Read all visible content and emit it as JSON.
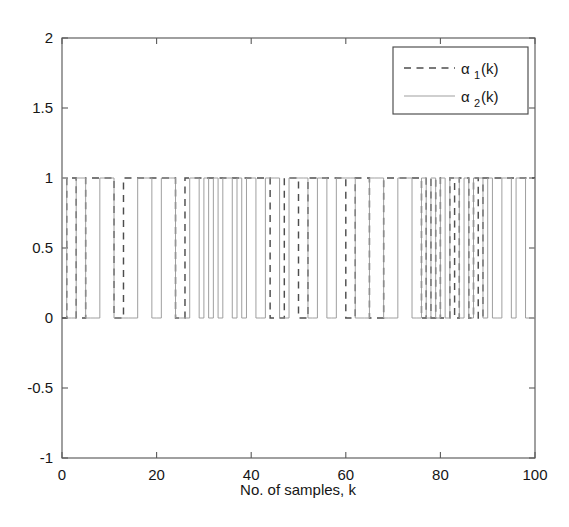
{
  "chart_data": {
    "type": "line",
    "title": "",
    "xlabel": "No. of samples, k",
    "ylabel": "",
    "xlim": [
      0,
      100
    ],
    "ylim": [
      -1,
      2
    ],
    "xticks": [
      0,
      20,
      40,
      60,
      80,
      100
    ],
    "xticklabels": [
      "0",
      "20",
      "40",
      "60",
      "80",
      "100"
    ],
    "yticks": [
      -1,
      -0.5,
      0,
      0.5,
      1,
      1.5,
      2
    ],
    "yticklabels": [
      "-1",
      "-0.5",
      "0",
      "0.5",
      "1",
      "1.5",
      "2"
    ],
    "grid": false,
    "legend_position": "upper right",
    "series": [
      {
        "name": "alpha_1(k)",
        "label_base": "α",
        "label_sub": "1",
        "label_tail": "(k)",
        "style": "dashed",
        "color": "#4d4d4d",
        "description": "binary switching signal, values 0 or 1, step-held per sample",
        "x": [
          0,
          1,
          2,
          3,
          4,
          5,
          6,
          7,
          8,
          9,
          10,
          11,
          12,
          13,
          14,
          15,
          16,
          17,
          18,
          19,
          20,
          21,
          22,
          23,
          24,
          25,
          26,
          27,
          28,
          29,
          30,
          31,
          32,
          33,
          34,
          35,
          36,
          37,
          38,
          39,
          40,
          41,
          42,
          43,
          44,
          45,
          46,
          47,
          48,
          49,
          50,
          51,
          52,
          53,
          54,
          55,
          56,
          57,
          58,
          59,
          60,
          61,
          62,
          63,
          64,
          65,
          66,
          67,
          68,
          69,
          70,
          71,
          72,
          73,
          74,
          75,
          76,
          77,
          78,
          79,
          80,
          81,
          82,
          83,
          84,
          85,
          86,
          87,
          88,
          89,
          90,
          91,
          92,
          93,
          94,
          95,
          96,
          97,
          98,
          99,
          100
        ],
        "values": [
          0,
          1,
          1,
          0,
          0,
          1,
          1,
          1,
          1,
          1,
          1,
          0,
          0,
          1,
          1,
          1,
          1,
          1,
          1,
          1,
          1,
          1,
          1,
          1,
          0,
          0,
          1,
          1,
          1,
          1,
          1,
          1,
          1,
          1,
          1,
          1,
          1,
          1,
          1,
          1,
          1,
          1,
          1,
          1,
          0,
          0,
          0,
          1,
          1,
          1,
          0,
          0,
          1,
          1,
          1,
          1,
          1,
          1,
          1,
          1,
          0,
          0,
          1,
          1,
          1,
          0,
          0,
          0,
          1,
          1,
          1,
          1,
          1,
          1,
          1,
          1,
          0,
          1,
          0,
          1,
          0,
          0,
          1,
          0,
          1,
          1,
          0,
          1,
          0,
          1,
          1,
          1,
          1,
          1,
          1,
          1,
          1,
          1,
          1,
          1,
          1
        ]
      },
      {
        "name": "alpha_2(k)",
        "label_base": "α",
        "label_sub": "2",
        "label_tail": "(k)",
        "style": "solid",
        "color": "#9a9a9a",
        "description": "binary switching signal, complement-like, values 0 or 1, step-held per sample",
        "x": [
          0,
          1,
          2,
          3,
          4,
          5,
          6,
          7,
          8,
          9,
          10,
          11,
          12,
          13,
          14,
          15,
          16,
          17,
          18,
          19,
          20,
          21,
          22,
          23,
          24,
          25,
          26,
          27,
          28,
          29,
          30,
          31,
          32,
          33,
          34,
          35,
          36,
          37,
          38,
          39,
          40,
          41,
          42,
          43,
          44,
          45,
          46,
          47,
          48,
          49,
          50,
          51,
          52,
          53,
          54,
          55,
          56,
          57,
          58,
          59,
          60,
          61,
          62,
          63,
          64,
          65,
          66,
          67,
          68,
          69,
          70,
          71,
          72,
          73,
          74,
          75,
          76,
          77,
          78,
          79,
          80,
          81,
          82,
          83,
          84,
          85,
          86,
          87,
          88,
          89,
          90,
          91,
          92,
          93,
          94,
          95,
          96,
          97,
          98,
          99,
          100
        ],
        "values": [
          1,
          0,
          0,
          1,
          1,
          0,
          0,
          0,
          1,
          1,
          1,
          0,
          0,
          0,
          0,
          0,
          1,
          1,
          1,
          0,
          0,
          1,
          1,
          1,
          0,
          0,
          0,
          1,
          1,
          0,
          1,
          0,
          1,
          0,
          1,
          1,
          0,
          1,
          0,
          1,
          1,
          0,
          0,
          1,
          1,
          1,
          0,
          0,
          1,
          1,
          1,
          1,
          0,
          0,
          1,
          1,
          0,
          0,
          1,
          1,
          1,
          1,
          0,
          0,
          0,
          1,
          1,
          1,
          0,
          0,
          0,
          1,
          1,
          1,
          0,
          0,
          1,
          0,
          1,
          0,
          1,
          0,
          1,
          1,
          0,
          1,
          0,
          1,
          1,
          0,
          1,
          0,
          0,
          1,
          1,
          0,
          1,
          1,
          0,
          0,
          1
        ]
      }
    ]
  },
  "axes": {
    "x_axis_label": "No. of samples, k",
    "box_outline": true,
    "frame_color": "#5a5a5a"
  },
  "legend": {
    "entries": [
      {
        "base": "α",
        "sub": "1",
        "tail": "(k)",
        "style": "dashed"
      },
      {
        "base": "α",
        "sub": "2",
        "tail": "(k)",
        "style": "solid"
      }
    ]
  }
}
